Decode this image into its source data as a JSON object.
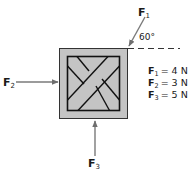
{
  "diagram": {
    "forces": [
      {
        "id": "F1",
        "label": "F",
        "sub": "1",
        "angle_label": "60°"
      },
      {
        "id": "F2",
        "label": "F",
        "sub": "2"
      },
      {
        "id": "F3",
        "label": "F",
        "sub": "3"
      }
    ],
    "legend": [
      {
        "name": "F",
        "sub": "1",
        "eq": "= 4 N"
      },
      {
        "name": "F",
        "sub": "2",
        "eq": "= 3 N"
      },
      {
        "name": "F",
        "sub": "3",
        "eq": "= 5 N"
      }
    ],
    "colors": {
      "crate_fill": "#c4c4c4",
      "stroke": "#1a1a1a",
      "arrow": "#7a7a7a"
    }
  }
}
